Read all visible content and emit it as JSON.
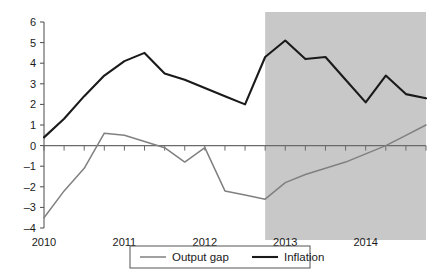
{
  "chart_data": {
    "type": "line",
    "title": "",
    "xlabel": "",
    "ylabel": "",
    "ylim": [
      -4,
      6
    ],
    "xlim": [
      "2010Q1",
      "2014Q4"
    ],
    "grid": false,
    "legend_position": "bottom",
    "y_ticks": [
      "6",
      "5",
      "4",
      "3",
      "2",
      "1",
      "0",
      "-1",
      "-2",
      "-3",
      "-4"
    ],
    "y_tick_values": [
      6,
      5,
      4,
      3,
      2,
      1,
      0,
      -1,
      -2,
      -3,
      -4
    ],
    "x_tick_labels": [
      "2010",
      "2011",
      "2012",
      "2013",
      "2014"
    ],
    "x_tick_values": [
      "2010Q1",
      "2011Q1",
      "2012Q1",
      "2013Q1",
      "2014Q1"
    ],
    "x": [
      "2010Q1",
      "2010Q2",
      "2010Q3",
      "2010Q4",
      "2011Q1",
      "2011Q2",
      "2011Q3",
      "2011Q4",
      "2012Q1",
      "2012Q2",
      "2012Q3",
      "2012Q4",
      "2013Q1",
      "2013Q2",
      "2013Q3",
      "2013Q4",
      "2014Q1",
      "2014Q2",
      "2014Q3",
      "2014Q4"
    ],
    "series": [
      {
        "name": "Output gap",
        "color": "#808080",
        "values": [
          -3.5,
          -2.2,
          -1.1,
          0.6,
          0.5,
          0.2,
          -0.1,
          -0.8,
          -0.1,
          -2.2,
          -2.4,
          -2.6,
          -1.8,
          -1.4,
          -1.1,
          -0.8,
          -0.4,
          0.0,
          0.5,
          1.0
        ]
      },
      {
        "name": "Inflation",
        "color": "#1a1a1a",
        "values": [
          0.4,
          1.3,
          2.4,
          3.4,
          4.1,
          4.5,
          3.5,
          3.2,
          2.8,
          2.4,
          2.0,
          4.3,
          5.1,
          4.2,
          4.3,
          3.2,
          2.1,
          3.4,
          2.5,
          2.3
        ]
      }
    ],
    "annotations": [
      {
        "name": "forecast-shading",
        "type": "vspan",
        "from": "2012Q4",
        "to": "2014Q4",
        "color": "#c8c8c8"
      }
    ],
    "legend": [
      {
        "label": "Output gap",
        "color": "#808080"
      },
      {
        "label": "Inflation",
        "color": "#1a1a1a"
      }
    ]
  }
}
